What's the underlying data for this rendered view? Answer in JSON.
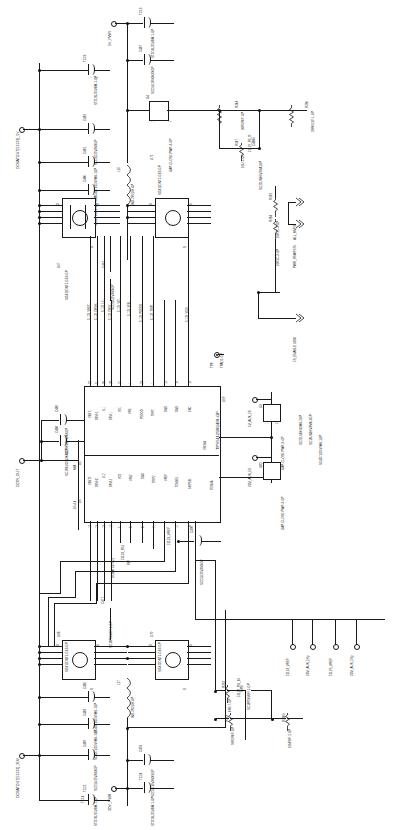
{
  "sheet": {
    "title": "Dual Synchronous Buck Controller Power Schematic",
    "rotation": "90deg CCW (text reads bottom-to-top)",
    "line_color": "#1a1a1a",
    "background": "#ffffff"
  },
  "nets": {
    "dcbatout_5v": "DCBATOUT[51123]_5V",
    "dcbatout_3dv": "DCBATOUT[51123]_3DV",
    "dcin_out": "DCIN_OUT",
    "pwr_5v": "5V_PWR",
    "pwr_3dv": "3DV_PWR",
    "vref_51123": "51123_VREF",
    "vref_5112s": "5112S_VREF",
    "aux_5s_3dv_a": "3DV_AUX_5Sp",
    "aux_5s_3dv_b": "3DV_AUX_5Sp",
    "aux_5s_5v": "5V_AUX_5S",
    "aux_5s_3dv_c": "3DV_AUX_5S",
    "vclk_51123": "51123_VCLK",
    "vbst1": "51123_VBST1",
    "drvh1": "51123_DRVH1",
    "ll1": "51123_LL1",
    "drvl1": "51123_DRVL1",
    "vo1": "51123_VO1",
    "vfb1": "51123_VFB1",
    "pgood": "51123_PGOOD",
    "trip1": "51123_TRIP1",
    "vbst2": "51123_VBST2",
    "drvh2": "51123_DRVH2",
    "ll2": "51123_LL2",
    "drvl2": "51123_DRVL2",
    "vo2": "51123_VO2",
    "vfb2": "51123_VFB2",
    "gnd2": "51123_GND",
    "trip2": "51123_TRIP2",
    "vref_pin": "51123_VREF",
    "tonsel": "51123_TONSEL",
    "skipsel": "51123_SKIPSEL",
    "fb_net": "51123_FB1",
    "pg_in": "51129_PG_IN",
    "fb_r": "51129_FB_R"
  },
  "signals": [
    {
      "name": "ALL_MVRD",
      "style": "double-chevron"
    },
    {
      "name": "PWR_RSMRST#",
      "style": "double-chevron"
    },
    {
      "name": "5S_ENABLE  3338",
      "style": "double-chevron"
    },
    {
      "name": "SC22LNE0V3MK-2GP",
      "style": "double-chevron"
    },
    {
      "name": "SC18UNE0V3MK-3GP",
      "style": "double-chevron"
    }
  ],
  "ics": [
    {
      "ref": "U69",
      "part": "TPS51125RGER-GP",
      "description": "Dual synchronous step-down controller",
      "pins_top": [
        {
          "num": "32",
          "name": "VBST1"
        },
        {
          "num": "31",
          "name": "DRVH1"
        },
        {
          "num": "30",
          "name": "LL1"
        },
        {
          "num": "29",
          "name": "DRVL1"
        },
        {
          "num": "24",
          "name": "VO1"
        },
        {
          "num": "1",
          "name": "VFB1"
        },
        {
          "num": "23",
          "name": "PGOOD"
        },
        {
          "num": "1",
          "name": "TRIP1"
        },
        {
          "num": "15",
          "name": "GND"
        },
        {
          "num": "16",
          "name": "GND"
        },
        {
          "num": "18",
          "name": "ENC"
        }
      ],
      "pins_bottom": [
        {
          "num": "13",
          "name": "VBST2"
        },
        {
          "num": "13",
          "name": "DRVH2"
        },
        {
          "num": "13",
          "name": "LL2"
        },
        {
          "num": "12",
          "name": "DRVL2"
        },
        {
          "num": "7",
          "name": "VO2"
        },
        {
          "num": "6",
          "name": "VFB2"
        },
        {
          "num": "8",
          "name": "GND"
        },
        {
          "num": "11",
          "name": "TRIP2"
        },
        {
          "num": "1",
          "name": "VREF"
        },
        {
          "num": "14",
          "name": "TONSEL"
        },
        {
          "num": "16",
          "name": "SKIPSEL"
        }
      ],
      "pins_right": [
        {
          "num": "21",
          "name": "VSOSA"
        },
        {
          "num": "",
          "name": "COSMA"
        }
      ]
    }
  ],
  "mosfets": [
    {
      "ref": "U67",
      "part": "SI5412DNT1-GE3-GP",
      "pins": [
        "D",
        "G",
        "S"
      ]
    },
    {
      "ref": "U71",
      "part": "SI5412DNT1-GE3-GP",
      "pins": [
        "D",
        "G",
        "S"
      ]
    },
    {
      "ref": "U68",
      "part": "SI5412DNT1-GE3-GP",
      "pins": [
        "D",
        "G",
        "S"
      ]
    },
    {
      "ref": "U70",
      "part": "SI5412DNT1-GE3-GP",
      "pins": [
        "D",
        "G",
        "S"
      ]
    }
  ],
  "capacitors": [
    {
      "ref": "TC13",
      "part": "ST5D6U25VBM-1-GP"
    },
    {
      "ref": "C487",
      "part": "SCD1U1RV3K3XGP"
    },
    {
      "ref": "TC26",
      "part": "ST5D6U25VBM-1-GP"
    },
    {
      "ref": "C482",
      "part": "SCD1U25V3KXGP"
    },
    {
      "ref": "C481",
      "part": "SC4D7U25V9MK-1GP"
    },
    {
      "ref": "C480",
      "part": "SC4D7U25V9MK-1GP"
    },
    {
      "ref": "C486",
      "part": "SC1R0U50V3KXGP"
    },
    {
      "ref": "C488",
      "part": "SC1R0U25V3KXGP"
    },
    {
      "ref": "C491",
      "part": "SCD1U25V3KXGP"
    },
    {
      "ref": "C477",
      "part": "SC18P50V0R-1-GP"
    },
    {
      "ref": "C488b",
      "part": "SC22UNE0V2KA1GP"
    },
    {
      "ref": "C490",
      "part": "SCD1U25V3KXGP"
    },
    {
      "ref": "C493",
      "part": "SCD1U10V3KXSGP"
    },
    {
      "ref": "TC24",
      "part": "ST5D6U25VBM-1-GP"
    },
    {
      "ref": "C483",
      "part": "SC4D7U25V9MK-1GP"
    },
    {
      "ref": "C485",
      "part": "SC4D7U25V9MK-1GP"
    },
    {
      "ref": "C489",
      "part": "SCD1U25V3KXGP"
    },
    {
      "ref": "TC25",
      "part": "ST5D6U25VBM-1-GP"
    },
    {
      "ref": "C495",
      "part": "SC18P50V0R-1-GP"
    },
    {
      "ref": "C492",
      "part": "SCD1U10V3KXSGP"
    },
    {
      "ref": "TC14",
      "part": "ST5D6U25VBM-1-GP"
    }
  ],
  "resistors": [
    {
      "ref": "R244",
      "part": "30R5R0F-GP"
    },
    {
      "ref": "R230",
      "part": "20R0G1F-L-GP"
    },
    {
      "ref": "R247",
      "part": "10U-2-GP"
    },
    {
      "ref": "R281",
      "part": "10R2C-3-GP"
    },
    {
      "ref": "R284",
      "part": "10R2C-3-GP"
    },
    {
      "ref": "R232",
      "part": "0R0-7-GP"
    },
    {
      "ref": "R233",
      "part": "90R5R0F-GP"
    },
    {
      "ref": "R230b",
      "part": "10NR0F-2-GP"
    },
    {
      "ref": "R280",
      "part": "30R0F-GP"
    },
    {
      "ref": "R282",
      "part": "10R2C-3-GP"
    }
  ],
  "inductors": [
    {
      "ref": "L16",
      "part": "IND-2R2UH-GP"
    },
    {
      "ref": "L17",
      "part": "IND-2R2UH-GP"
    }
  ],
  "misc_parts": [
    {
      "ref": "G4",
      "part": "GAP-CLOSE-PWR-3-GP"
    },
    {
      "ref": "G3",
      "part": "GAP-CLOSE-PWR-3-GP"
    },
    {
      "ref": "G82",
      "part": "GAP-CLOSE-PWR-3-GP"
    },
    {
      "ref": "L17b",
      "part": "GAP-CLOSE-PWR-3-GP"
    },
    {
      "ref": "U5",
      "part": "M/A"
    },
    {
      "ref": "U6",
      "part": "-10+14"
    },
    {
      "ref": "TP8",
      "part": "TPAD1-GP"
    },
    {
      "ref": "TP9",
      "part": "TPAD1-GP"
    }
  ],
  "testpoints": [
    {
      "ref": "TP8",
      "label": "TPAD1-GP"
    },
    {
      "ref": "TP9",
      "label": "TPAD1-GP"
    }
  ],
  "ports": [
    {
      "label": "DCBATOUT[51123]_5V"
    },
    {
      "label": "5V_PWR"
    },
    {
      "label": "DCIN_OUT"
    },
    {
      "label": "DCBATOUT[51123]_3DV"
    },
    {
      "label": "3DV_PWR"
    },
    {
      "label": "51123_VREF"
    },
    {
      "label": "3DV_AUX_5Sp"
    },
    {
      "label": "5112S_VREF"
    },
    {
      "label": "3DV_AUX_5Sp"
    },
    {
      "label": "5V_AUX_5S"
    },
    {
      "label": "3DV_AUX_5S"
    },
    {
      "label": "51123_VCLK"
    }
  ]
}
